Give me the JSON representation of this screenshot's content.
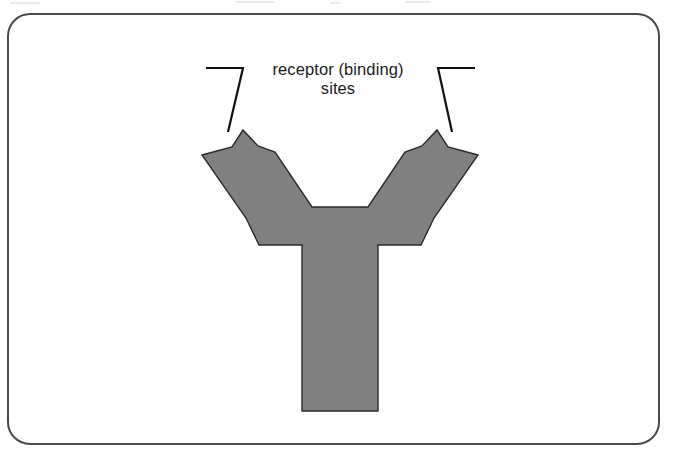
{
  "figure": {
    "kind": "biology-diagram",
    "frame": {
      "border_color": "#4a4a4a",
      "border_width_px": 2,
      "corner_radius_px": 22,
      "background": "#ffffff",
      "bounds": {
        "x": 7,
        "y": 13,
        "width": 653,
        "height": 432
      }
    },
    "label": {
      "text": "receptor (binding)\nsites",
      "line1": "receptor (binding)",
      "line2": "sites",
      "color": "#1b1b1b",
      "font_size_px": 16.5,
      "align": "center"
    },
    "leaders": [
      {
        "name": "left-leader",
        "description": "horizontal bracket segment then diagonal down-right to left arm tip",
        "color": "#121212",
        "stroke_width_px": 2.2,
        "points": [
          [
            206,
            68
          ],
          [
            243,
            68
          ],
          [
            243,
            68
          ],
          [
            228,
            132
          ]
        ]
      },
      {
        "name": "right-leader",
        "description": "horizontal bracket segment then diagonal down-left to right arm tip",
        "color": "#121212",
        "stroke_width_px": 2.2,
        "points": [
          [
            475,
            68
          ],
          [
            438,
            68
          ],
          [
            438,
            68
          ],
          [
            452,
            132
          ]
        ]
      }
    ],
    "molecule": {
      "name": "antibody-y-shape",
      "fill_color": "#808081",
      "outline_color": "#2a2a2a",
      "outline_width_px": 1.4,
      "polygon": [
        [
          243,
          130
        ],
        [
          258,
          146
        ],
        [
          275,
          152
        ],
        [
          312,
          207
        ],
        [
          368,
          207
        ],
        [
          405,
          152
        ],
        [
          422,
          146
        ],
        [
          437,
          130
        ],
        [
          448,
          147
        ],
        [
          478,
          155
        ],
        [
          434,
          218
        ],
        [
          421,
          245
        ],
        [
          378,
          245
        ],
        [
          378,
          411
        ],
        [
          302,
          411
        ],
        [
          302,
          245
        ],
        [
          259,
          245
        ],
        [
          246,
          218
        ],
        [
          202,
          155
        ],
        [
          232,
          147
        ]
      ],
      "features": [
        {
          "name": "left-binding-arm",
          "description": "upper-left forked arm with notched tip"
        },
        {
          "name": "right-binding-arm",
          "description": "upper-right forked arm with notched tip"
        },
        {
          "name": "stem",
          "description": "vertical constant region stem",
          "x_range": [
            302,
            378
          ],
          "y_range": [
            245,
            411
          ]
        },
        {
          "name": "central-notch",
          "description": "flat-bottomed V between the two arms",
          "y": 207
        }
      ]
    }
  },
  "chart_data": {
    "type": "diagram",
    "title": "receptor (binding) sites",
    "annotations": [
      "receptor (binding)",
      "sites"
    ]
  }
}
